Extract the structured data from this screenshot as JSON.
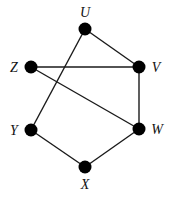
{
  "diagram": {
    "type": "graph",
    "nodes": [
      {
        "id": "U",
        "label": "U",
        "x": 85,
        "y": 29,
        "lx": 85,
        "ly": 17
      },
      {
        "id": "V",
        "label": "V",
        "x": 139,
        "y": 67,
        "lx": 156,
        "ly": 72
      },
      {
        "id": "W",
        "label": "W",
        "x": 139,
        "y": 129,
        "lx": 157,
        "ly": 134
      },
      {
        "id": "X",
        "label": "X",
        "x": 85,
        "y": 167,
        "lx": 85,
        "ly": 189
      },
      {
        "id": "Y",
        "label": "Y",
        "x": 31,
        "y": 130,
        "lx": 14,
        "ly": 135
      },
      {
        "id": "Z",
        "label": "Z",
        "x": 31,
        "y": 67,
        "lx": 14,
        "ly": 72
      }
    ],
    "edges": [
      [
        "U",
        "V"
      ],
      [
        "U",
        "Y"
      ],
      [
        "Z",
        "V"
      ],
      [
        "Z",
        "W"
      ],
      [
        "V",
        "W"
      ],
      [
        "Y",
        "X"
      ],
      [
        "X",
        "W"
      ]
    ],
    "colors": {
      "node": "#000000",
      "edge": "#1a1a1a",
      "background": "#ffffff"
    }
  }
}
